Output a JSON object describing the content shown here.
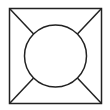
{
  "diagram": {
    "stroke_color": "#222222",
    "background": "#ffffff",
    "square": {
      "x": 9.5,
      "y": 8.5,
      "width": 92,
      "height": 95
    },
    "circle": {
      "cx": 55.5,
      "cy": 56,
      "r": 31
    }
  }
}
